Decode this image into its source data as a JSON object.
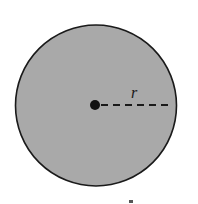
{
  "diagram": {
    "shape": "circle",
    "fill_color": "#a9a9a9",
    "stroke_color": "#1a1a1a",
    "center": {
      "x": 96,
      "y": 105.5
    },
    "radius": 81,
    "center_point": {
      "x": 95,
      "y": 105,
      "radius": 5,
      "color": "#111111"
    },
    "radius_line": {
      "x1": 101,
      "y1": 105,
      "x2": 172,
      "y2": 105,
      "style": "dashed"
    },
    "radius_label": "r"
  }
}
